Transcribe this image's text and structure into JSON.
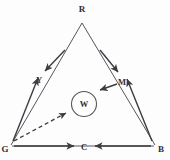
{
  "figure": {
    "background_color": "#fdfdfd",
    "line_color": "#55555c",
    "arrow_color": "#3b3b41",
    "text_color": "#2f2f33"
  },
  "nodes": [
    {
      "id": "R",
      "label": "R",
      "x": 82,
      "y": 21,
      "label_x": 82,
      "label_y": 12,
      "role": "triangle-apex-top"
    },
    {
      "id": "G",
      "label": "G",
      "x": 11,
      "y": 144,
      "label_x": 5,
      "label_y": 151,
      "role": "triangle-vertex-bottom-left"
    },
    {
      "id": "B",
      "label": "B",
      "x": 154,
      "y": 144,
      "label_x": 161,
      "label_y": 151,
      "role": "triangle-vertex-bottom-right"
    },
    {
      "id": "Y",
      "label": "Y",
      "x": 40,
      "y": 80,
      "label_x": 39,
      "label_y": 80,
      "role": "midpoint-left-edge"
    },
    {
      "id": "M",
      "label": "M",
      "x": 122,
      "y": 82,
      "label_x": 122,
      "label_y": 82,
      "role": "midpoint-right-edge"
    },
    {
      "id": "C",
      "label": "C",
      "x": 84,
      "y": 147,
      "label_x": 84,
      "label_y": 150,
      "role": "midpoint-bottom-edge"
    },
    {
      "id": "W",
      "label": "W",
      "x": 84,
      "y": 104,
      "label_x": 84,
      "label_y": 107,
      "role": "center-circle"
    }
  ],
  "circle": {
    "name": "white-circle",
    "cx": 84,
    "cy": 104,
    "r": 12.5,
    "label": "W"
  },
  "triangle_edges": [
    {
      "name": "edge-R-G",
      "x1": 82,
      "y1": 23,
      "x2": 11,
      "y2": 145
    },
    {
      "name": "edge-R-B",
      "x1": 82,
      "y1": 23,
      "x2": 155,
      "y2": 145
    },
    {
      "name": "edge-G-B",
      "x1": 12,
      "y1": 146,
      "x2": 154,
      "y2": 146
    }
  ],
  "arrows": [
    {
      "name": "arrow-R-to-Y",
      "from": "R",
      "to": "Y",
      "x1": 65,
      "y1": 52,
      "x2": 44,
      "y2": 72,
      "style": "solid"
    },
    {
      "name": "arrow-R-to-M",
      "from": "R",
      "to": "M",
      "x1": 100,
      "y1": 52,
      "x2": 118,
      "y2": 74,
      "style": "solid"
    },
    {
      "name": "arrow-G-to-Y",
      "from": "G",
      "to": "Y",
      "x1": 13,
      "y1": 142,
      "x2": 38,
      "y2": 76,
      "style": "solid"
    },
    {
      "name": "arrow-B-to-M",
      "from": "B",
      "to": "M",
      "x1": 152,
      "y1": 142,
      "x2": 126,
      "y2": 78,
      "style": "solid"
    },
    {
      "name": "arrow-G-to-C",
      "from": "G",
      "to": "C",
      "x1": 14,
      "y1": 146,
      "x2": 74,
      "y2": 146,
      "style": "solid"
    },
    {
      "name": "arrow-B-to-C",
      "from": "B",
      "to": "C",
      "x1": 151,
      "y1": 146,
      "x2": 94,
      "y2": 146,
      "style": "solid"
    },
    {
      "name": "arrow-M-to-W",
      "from": "M",
      "to": "W",
      "x1": 116,
      "y1": 84,
      "x2": 99,
      "y2": 91,
      "style": "solid"
    },
    {
      "name": "arrow-G-to-W",
      "from": "G",
      "to": "W",
      "x1": 14,
      "y1": 141,
      "x2": 68,
      "y2": 112,
      "style": "dashed"
    }
  ]
}
